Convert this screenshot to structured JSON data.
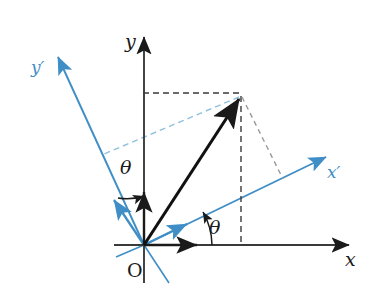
{
  "figure": {
    "colors": {
      "axis": "#1a1a1a",
      "rotated_axis": "#3f8ec6",
      "dashed_black": "#3a3a3a",
      "dashed_blue": "#7fb8dd",
      "dashed_gray": "#8a8a8a",
      "background": "#ffffff"
    },
    "labels": {
      "x_axis": "x",
      "y_axis": "y",
      "x_prime_axis": "x′",
      "y_prime_axis": "y′",
      "origin": "O",
      "theta_lower": "θ",
      "theta_upper": "θ"
    },
    "geometry": {
      "origin": [
        144,
        245
      ],
      "y_axis_tip": [
        144,
        33
      ],
      "x_axis_tip": [
        353,
        245
      ],
      "x_prime_tip": [
        330,
        155
      ],
      "y_prime_tip": [
        55,
        53
      ],
      "vector_tip": [
        240,
        96
      ],
      "rotation_angle_deg": 25
    },
    "elements": [
      "y-axis with arrowhead",
      "x-axis with arrowhead",
      "rotated x-prime axis with arrowhead",
      "rotated y-prime axis with arrowhead",
      "position vector from origin",
      "unit vector arrowheads on all four axes",
      "dashed projection lines to x and y axes",
      "dashed projection lines to x-prime and y-prime axes",
      "two angle arcs labelled theta"
    ]
  }
}
